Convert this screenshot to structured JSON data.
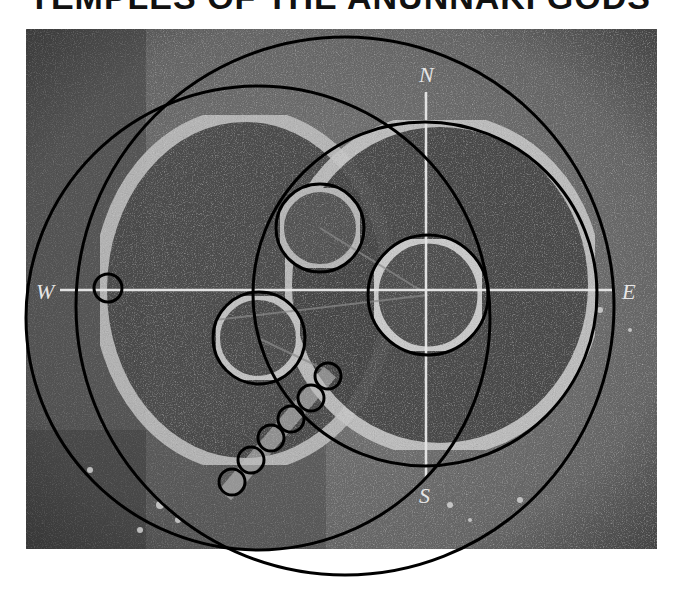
{
  "title": "TEMPLES OF THE ANUNNAKI GODS",
  "compass": {
    "north": "N",
    "south": "S",
    "east": "E",
    "west": "W"
  },
  "colors": {
    "background": "#ffffff",
    "photo_dark": "#3a3a3a",
    "photo_mid": "#6e6e6e",
    "ring_light": "#bdbdbd",
    "circle_stroke": "#000000",
    "axis_line": "#dcdcdc"
  },
  "figure": {
    "large_circles": 3,
    "medium_circles": 3,
    "small_circles": 7
  }
}
